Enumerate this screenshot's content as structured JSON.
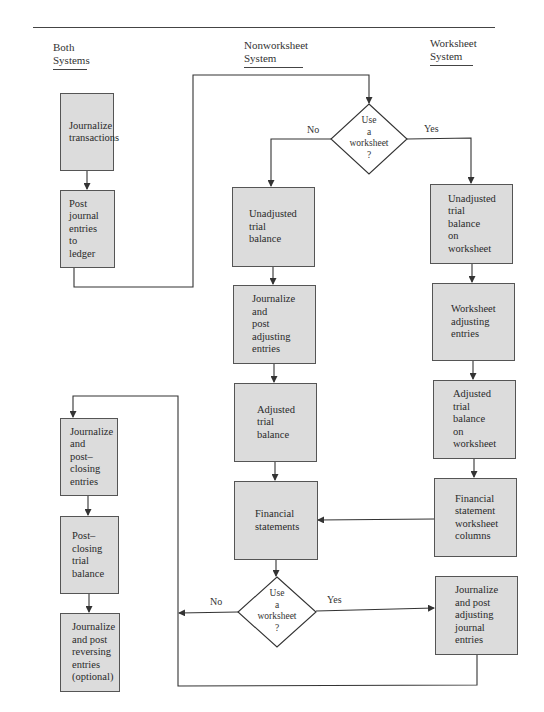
{
  "figure": {
    "type": "flowchart",
    "column_headers": {
      "both": "Both\nSystems",
      "nonworksheet": "Nonworksheet\nSystem",
      "worksheet": "Worksheet\nSystem"
    },
    "boxes": {
      "journalize_transactions": "Journalize\ntransactions",
      "post_journal": "Post journal\nentries\nto\nledger",
      "unadjusted_tb": "Unadjusted\ntrial\nbalance",
      "journalize_post_adjusting": "Journalize\nand\npost\nadjusting\nentries",
      "adjusted_tb": "Adjusted\ntrial\nbalance",
      "financial_statements": "Financial\nstatements",
      "unadjusted_tb_ws": "Unadjusted\ntrial\nbalance\non\nworksheet",
      "ws_adjusting": "Worksheet\nadjusting\nentries",
      "adjusted_tb_ws": "Adjusted\ntrial\nbalance\non\nworksheet",
      "fs_ws_columns": "Financial\nstatement\nworksheet\ncolumns",
      "journalize_post_adj_journal": "Journalize\nand post\nadjusting\njournal\nentries",
      "closing_entries": "Journalize\nand\npost–\nclosing\nentries",
      "post_closing_tb": "Post–closing\ntrial\nbalance",
      "reversing_entries": "Journalize\nand post\nreversing\nentries\n(optional)"
    },
    "decisions": {
      "top": {
        "text": "Use\na\nworksheet\n?",
        "no": "No",
        "yes": "Yes"
      },
      "bottom": {
        "text": "Use\na\nworksheet\n?",
        "no": "No",
        "yes": "Yes"
      }
    },
    "colors": {
      "box_fill": "#dcdcdc",
      "line": "#333333",
      "background": "#ffffff"
    }
  }
}
